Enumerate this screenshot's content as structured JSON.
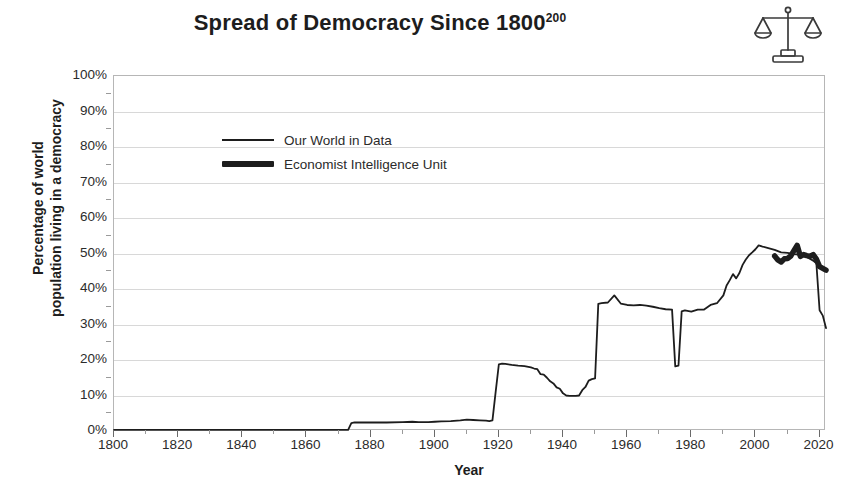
{
  "title": {
    "main": "Spread of Democracy Since 1800",
    "superscript": "200"
  },
  "icon": {
    "name": "balance-scales-icon"
  },
  "axes": {
    "y_title_line1": "Percentage of world",
    "y_title_line2": "population living in a democracy",
    "x_title": "Year",
    "y_ticks": [
      "0%",
      "10%",
      "20%",
      "30%",
      "40%",
      "50%",
      "60%",
      "70%",
      "80%",
      "90%",
      "100%"
    ],
    "x_ticks": [
      "1800",
      "1820",
      "1840",
      "1860",
      "1880",
      "1900",
      "1920",
      "1940",
      "1960",
      "1980",
      "2000",
      "2020"
    ]
  },
  "legend": {
    "items": [
      {
        "label": "Our World in Data",
        "style": "thin",
        "color": "#1d1d1d"
      },
      {
        "label": "Economist Intelligence Unit",
        "style": "thick",
        "color": "#1d1d1d"
      }
    ]
  },
  "chart_data": {
    "type": "line",
    "title": "Spread of Democracy Since 1800200",
    "xlabel": "Year",
    "ylabel": "Percentage of world population living in a democracy",
    "xlim": [
      1800,
      2022
    ],
    "ylim": [
      0,
      100
    ],
    "grid": true,
    "legend_position": "upper-left-inside",
    "ytick_values": [
      0,
      10,
      20,
      30,
      40,
      50,
      60,
      70,
      80,
      90,
      100
    ],
    "xtick_values": [
      1800,
      1820,
      1840,
      1860,
      1880,
      1900,
      1920,
      1940,
      1960,
      1980,
      2000,
      2020
    ],
    "xtick_minor_step": 10,
    "series": [
      {
        "name": "Our World in Data",
        "color": "#1d1d1d",
        "linewidth": 1.8,
        "x": [
          1800,
          1810,
          1820,
          1830,
          1840,
          1850,
          1860,
          1870,
          1873,
          1874,
          1875,
          1880,
          1885,
          1890,
          1893,
          1895,
          1898,
          1900,
          1902,
          1905,
          1908,
          1910,
          1912,
          1914,
          1916,
          1917,
          1918,
          1919,
          1920,
          1921,
          1922,
          1924,
          1926,
          1928,
          1930,
          1931,
          1932,
          1933,
          1934,
          1935,
          1936,
          1937,
          1938,
          1939,
          1940,
          1941,
          1942,
          1943,
          1944,
          1945,
          1946,
          1947,
          1948,
          1949,
          1950,
          1951,
          1952,
          1954,
          1956,
          1958,
          1960,
          1962,
          1964,
          1966,
          1968,
          1970,
          1972,
          1974,
          1975,
          1976,
          1977,
          1978,
          1980,
          1982,
          1984,
          1986,
          1988,
          1990,
          1991,
          1992,
          1993,
          1994,
          1995,
          1996,
          1997,
          1998,
          1999,
          2000,
          2001,
          2002,
          2004,
          2006,
          2008,
          2010,
          2012,
          2014,
          2016,
          2018,
          2019,
          2020,
          2021,
          2022
        ],
        "y": [
          0.3,
          0.3,
          0.3,
          0.3,
          0.3,
          0.3,
          0.3,
          0.3,
          0.3,
          2.2,
          2.4,
          2.4,
          2.4,
          2.5,
          2.6,
          2.5,
          2.5,
          2.6,
          2.7,
          2.8,
          3.0,
          3.2,
          3.1,
          3.0,
          2.9,
          2.8,
          3.0,
          11.0,
          18.8,
          19.0,
          18.9,
          18.6,
          18.4,
          18.3,
          17.9,
          17.6,
          17.4,
          16.0,
          15.9,
          15.0,
          14.0,
          13.4,
          12.3,
          11.9,
          10.6,
          10.0,
          9.9,
          9.9,
          9.9,
          10.0,
          11.5,
          12.4,
          14.2,
          14.6,
          14.8,
          35.8,
          36.0,
          36.2,
          38.2,
          35.9,
          35.5,
          35.4,
          35.5,
          35.3,
          35.0,
          34.6,
          34.3,
          34.2,
          18.2,
          18.4,
          33.7,
          34.0,
          33.6,
          34.2,
          34.2,
          35.5,
          36.0,
          38.2,
          41.0,
          42.5,
          44.2,
          43.0,
          44.5,
          46.8,
          48.3,
          49.5,
          50.3,
          51.2,
          52.3,
          52.0,
          51.5,
          51.0,
          50.3,
          50.2,
          49.8,
          49.6,
          49.0,
          48.0,
          47.2,
          34.0,
          32.5,
          29.0
        ]
      },
      {
        "name": "Economist Intelligence Unit",
        "color": "#1d1d1d",
        "linewidth": 5.5,
        "x": [
          2006,
          2007,
          2008,
          2009,
          2010,
          2011,
          2012,
          2013,
          2014,
          2015,
          2016,
          2017,
          2018,
          2019,
          2020,
          2021,
          2022
        ],
        "y": [
          49.3,
          48.2,
          47.6,
          48.5,
          48.6,
          49.3,
          50.8,
          52.3,
          49.2,
          49.7,
          49.4,
          49.2,
          49.7,
          48.4,
          46.3,
          45.8,
          45.3
        ]
      }
    ]
  }
}
